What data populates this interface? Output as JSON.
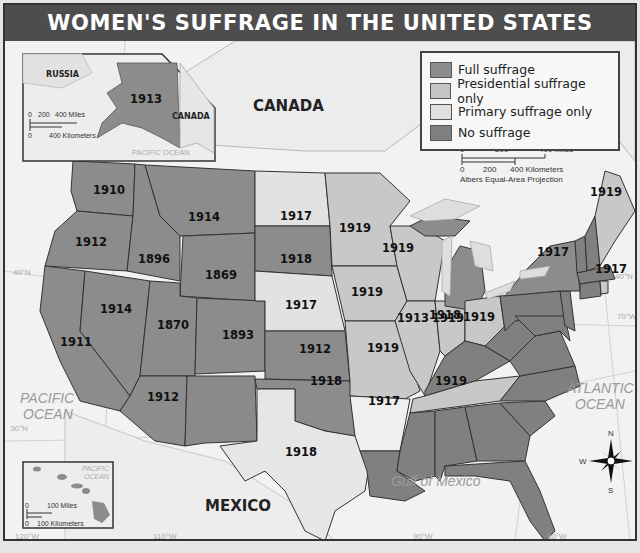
{
  "title": "WOMEN'S SUFFRAGE IN THE UNITED STATES BEFORE 1920",
  "legend": {
    "items": [
      {
        "label": "Full suffrage",
        "color": "#8c8c8c"
      },
      {
        "label": "Presidential suffrage only",
        "color": "#c4c4c4"
      },
      {
        "label": "Primary suffrage only",
        "color": "#e0e0e0"
      },
      {
        "label": "No  suffrage",
        "color": "#7f7f7f"
      }
    ]
  },
  "colors": {
    "full": "#8c8c8c",
    "presidential": "#c8c8c8",
    "primary": "#e4e4e4",
    "none": "#808080",
    "water": "#f4f4f4",
    "border": "#333333"
  },
  "labels": {
    "canada": "CANADA",
    "mexico": "MEXICO",
    "pacific_ocean": [
      "PACIFIC",
      "OCEAN"
    ],
    "atlantic_ocean": [
      "ATLANTIC",
      "OCEAN"
    ],
    "gulf": "Gulf of Mexico",
    "lat_40": "40°N",
    "lat_30": "30°N",
    "lon_120": "120°W",
    "lon_110": "110°W",
    "lon_90": "90°W",
    "lon_80": "80°W",
    "lon_70": "70°W",
    "lakes": [
      "Lake Superior",
      "Lake Michigan",
      "Lake Huron",
      "Lake Ontario",
      "Lake Erie"
    ]
  },
  "scale_main": {
    "miles": [
      "0",
      "200",
      "400 Miles"
    ],
    "km": [
      "0",
      "200",
      "400 Kilometers"
    ],
    "projection": "Albers Equal-Area Projection"
  },
  "alaska_inset": {
    "russia": "RUSSIA",
    "canada": "CANADA",
    "ocean": "PACIFIC OCEAN",
    "year": "1913",
    "miles": [
      "0",
      "200",
      "400 Miles"
    ],
    "km": [
      "0",
      "400 Kilometers"
    ]
  },
  "hawaii_inset": {
    "ocean": [
      "PACIFIC",
      "OCEAN"
    ],
    "miles": [
      "0",
      "100 Miles"
    ],
    "km": [
      "0",
      "100 Kilometers"
    ]
  },
  "compass": {
    "n": "N",
    "s": "S",
    "e": "E",
    "w": "W"
  },
  "states": [
    {
      "name": "Washington",
      "year": "1910",
      "type": "full"
    },
    {
      "name": "Oregon",
      "year": "1912",
      "type": "full"
    },
    {
      "name": "California",
      "year": "1911",
      "type": "full"
    },
    {
      "name": "Idaho",
      "year": "1896",
      "type": "full"
    },
    {
      "name": "Nevada",
      "year": "1914",
      "type": "full"
    },
    {
      "name": "Montana",
      "year": "1914",
      "type": "full"
    },
    {
      "name": "Wyoming",
      "year": "1869",
      "type": "full"
    },
    {
      "name": "Utah",
      "year": "1870",
      "type": "full"
    },
    {
      "name": "Colorado",
      "year": "1893",
      "type": "full"
    },
    {
      "name": "Arizona",
      "year": "1912",
      "type": "full"
    },
    {
      "name": "North Dakota",
      "year": "1917",
      "type": "presidential"
    },
    {
      "name": "South Dakota",
      "year": "1918",
      "type": "full"
    },
    {
      "name": "Nebraska",
      "year": "1917",
      "type": "presidential"
    },
    {
      "name": "Kansas",
      "year": "1912",
      "type": "full"
    },
    {
      "name": "Oklahoma",
      "year": "1918",
      "type": "full"
    },
    {
      "name": "Texas",
      "year": "1918",
      "type": "primary"
    },
    {
      "name": "Minnesota",
      "year": "1919",
      "type": "presidential"
    },
    {
      "name": "Iowa",
      "year": "1919",
      "type": "presidential"
    },
    {
      "name": "Missouri",
      "year": "1919",
      "type": "presidential"
    },
    {
      "name": "Arkansas",
      "year": "1917",
      "type": "primary"
    },
    {
      "name": "Wisconsin",
      "year": "1919",
      "type": "presidential"
    },
    {
      "name": "Illinois",
      "year": "1913",
      "type": "presidential"
    },
    {
      "name": "Michigan",
      "year": "1918",
      "type": "full"
    },
    {
      "name": "Indiana",
      "year": "1919",
      "type": "presidential"
    },
    {
      "name": "Ohio",
      "year": "1919",
      "type": "presidential"
    },
    {
      "name": "Tennessee",
      "year": "1919",
      "type": "presidential"
    },
    {
      "name": "New York",
      "year": "1917",
      "type": "full"
    },
    {
      "name": "Maine",
      "year": "1919",
      "type": "presidential"
    },
    {
      "name": "Rhode Island",
      "year": "1917",
      "type": "presidential"
    },
    {
      "name": "Alaska",
      "year": "1913",
      "type": "full"
    }
  ]
}
